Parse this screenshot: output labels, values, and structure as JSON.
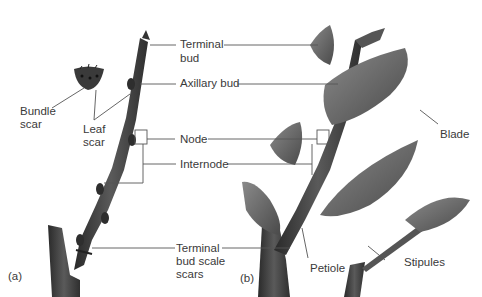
{
  "figure": {
    "panels": [
      {
        "id": "a",
        "label": "(a)"
      },
      {
        "id": "b",
        "label": "(b)"
      }
    ],
    "labels": {
      "terminal_bud_1": "Terminal",
      "terminal_bud_2": "bud",
      "axillary_bud": "Axillary bud",
      "bundle_scar_1": "Bundle",
      "bundle_scar_2": "scar",
      "leaf_scar_1": "Leaf",
      "leaf_scar_2": "scar",
      "node": "Node",
      "internode": "Internode",
      "terminal_bud_scale_scars_1": "Terminal",
      "terminal_bud_scale_scars_2": "bud scale",
      "terminal_bud_scale_scars_3": "scars",
      "blade": "Blade",
      "petiole": "Petiole",
      "stipules": "Stipules"
    },
    "colors": {
      "stem": "#3d3d3d",
      "leaf": "#6a6a6a",
      "leader_line": "#555555",
      "text": "#3a3a3a"
    }
  }
}
